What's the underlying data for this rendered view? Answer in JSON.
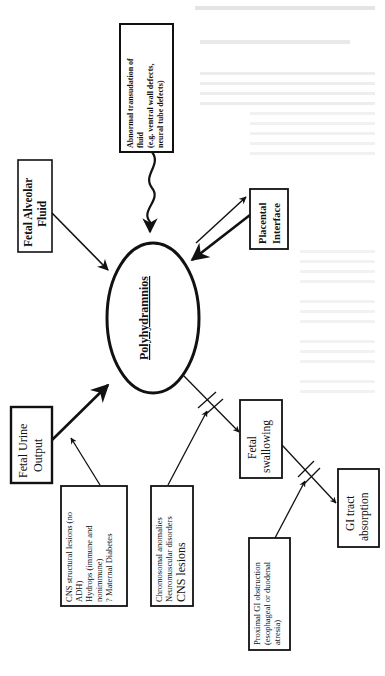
{
  "page": {
    "orientation": "rotated-90-ccw",
    "background_color": "#ffffff",
    "ink_color": "#111111",
    "faint_text_color": "#d9d9d9"
  },
  "diagram": {
    "center": {
      "label": "Polyhydramnios",
      "shape": "ellipse",
      "underlined": true
    },
    "nodes": {
      "transudation": {
        "lines": [
          "Abnormal transudation of",
          "fluid",
          "(e.g. ventral wall defects,",
          "neural tube defects)"
        ]
      },
      "alveolar": {
        "lines": [
          "Fetal Alveolar",
          "Fluid"
        ]
      },
      "placental": {
        "lines": [
          "Placental",
          "Interface"
        ]
      },
      "urine": {
        "lines": [
          "Fetal Urine",
          "Output"
        ]
      },
      "cns_structural": {
        "lines": [
          "CNS structural lesions (no",
          "ADH)",
          "Hydrops (immune  and",
          "nonimmune)",
          "? Maternal Diabetes"
        ]
      },
      "chromosomal": {
        "lines": [
          "Chromosomal anomalies",
          "Neuromuscular disorders",
          "CNS lesions"
        ]
      },
      "swallowing": {
        "lines": [
          "Fetal",
          "swallowing"
        ]
      },
      "gi_absorption": {
        "lines": [
          "GI tract",
          "absorption"
        ]
      },
      "proximal_gi": {
        "lines": [
          "Proximal GI obstruction",
          "(esophageal or duodenal",
          "atresia)"
        ]
      }
    },
    "edges": [
      {
        "from": "transudation",
        "to": "Polyhydramnios",
        "style": "wavy arrow"
      },
      {
        "from": "alveolar",
        "to": "Polyhydramnios",
        "style": "arrow"
      },
      {
        "from": "placental",
        "to": "Polyhydramnios",
        "style": "bidirectional double arrow"
      },
      {
        "from": "urine",
        "to": "Polyhydramnios",
        "style": "thick arrow"
      },
      {
        "from": "cns_structural",
        "to": "urine edge",
        "style": "arrow"
      },
      {
        "from": "Polyhydramnios",
        "to": "swallowing",
        "style": "arrow with block marks"
      },
      {
        "from": "chromosomal",
        "to": "swallowing edge",
        "style": "arrow (blocks)"
      },
      {
        "from": "swallowing",
        "to": "gi_absorption",
        "style": "arrow with block marks"
      },
      {
        "from": "proximal_gi",
        "to": "gi_absorption edge",
        "style": "arrow (blocks)"
      }
    ]
  }
}
